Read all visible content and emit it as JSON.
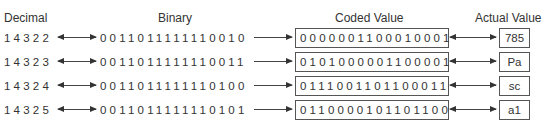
{
  "headers": {
    "decimal": "Decimal",
    "binary": "Binary",
    "coded": "Coded Value",
    "actual": "Actual Value"
  },
  "rows": [
    {
      "decimal": "14322",
      "binary": "0011011111110010",
      "coded": "0000001100010001",
      "actual": "785"
    },
    {
      "decimal": "14323",
      "binary": "0011011111110011",
      "coded": "0101000001100001",
      "actual": "Pa"
    },
    {
      "decimal": "14324",
      "binary": "0011011111110100",
      "coded": "0111001101100011",
      "actual": "sc"
    },
    {
      "decimal": "14325",
      "binary": "0011011111110101",
      "coded": "0110000101101100",
      "actual": "a1"
    }
  ],
  "icons": {
    "decimal_binary_arrow": "double-arrow",
    "binary_coded_arrow": "right-arrow",
    "coded_actual_arrow": "double-arrow"
  }
}
